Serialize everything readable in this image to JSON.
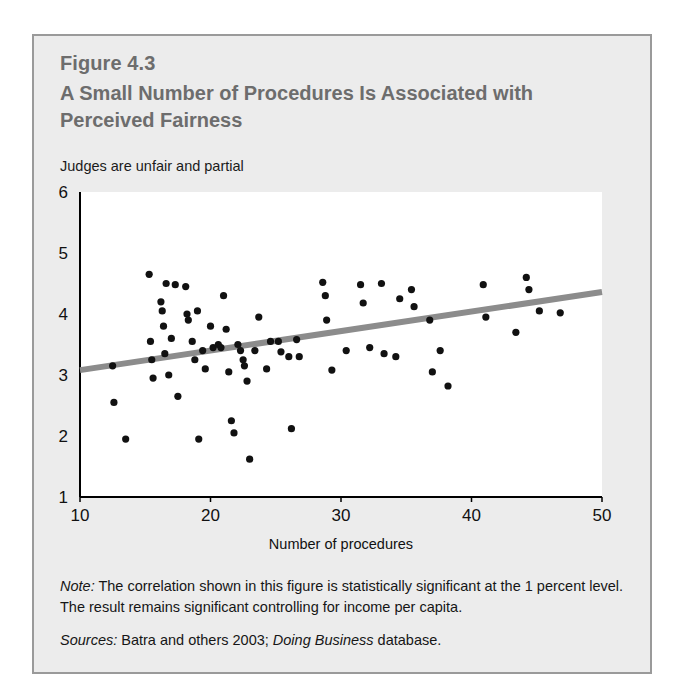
{
  "figure": {
    "number": "Figure 4.3",
    "title": "A Small Number of Procedures Is Associated with Perceived Fairness",
    "subtitle": "Judges are unfair and partial",
    "note_label": "Note:",
    "note_text": " The correlation shown in this figure is statistically significant at the 1 percent level. The result remains significant controlling for income per capita.",
    "sources_label": "Sources:",
    "sources_text_1": " Batra and others 2003; ",
    "sources_italic": "Doing Business",
    "sources_text_2": " database."
  },
  "colors": {
    "panel_background": "#ececec",
    "panel_border": "#9a9a9a",
    "title_text": "#6d6d6d",
    "body_text": "#161616",
    "plot_background": "#ffffff",
    "axis": "#000000",
    "point": "#111111",
    "trendline": "#8c8c8c"
  },
  "chart_data": {
    "type": "scatter",
    "title": "A Small Number of Procedures Is Associated with Perceived Fairness",
    "subtitle": "Judges are unfair and partial",
    "xlabel": "Number of procedures",
    "ylabel": "Judges are unfair and partial",
    "xlim": [
      10,
      50
    ],
    "ylim": [
      1,
      6
    ],
    "xticks": [
      10,
      20,
      30,
      40,
      50
    ],
    "yticks": [
      1,
      2,
      3,
      4,
      5,
      6
    ],
    "xtick_labels": [
      "10",
      "20",
      "30",
      "40",
      "50"
    ],
    "ytick_labels": [
      "1",
      "2",
      "3",
      "4",
      "5",
      "6"
    ],
    "grid": false,
    "legend": false,
    "points": [
      [
        12.5,
        3.15
      ],
      [
        12.6,
        2.55
      ],
      [
        13.5,
        1.95
      ],
      [
        15.3,
        4.65
      ],
      [
        15.4,
        3.55
      ],
      [
        15.5,
        3.25
      ],
      [
        15.6,
        2.95
      ],
      [
        16.2,
        4.2
      ],
      [
        16.3,
        4.05
      ],
      [
        16.4,
        3.8
      ],
      [
        16.5,
        3.35
      ],
      [
        16.6,
        4.5
      ],
      [
        16.8,
        3.0
      ],
      [
        17.0,
        3.6
      ],
      [
        17.3,
        4.48
      ],
      [
        17.5,
        2.65
      ],
      [
        18.1,
        4.45
      ],
      [
        18.2,
        4.0
      ],
      [
        18.3,
        3.9
      ],
      [
        18.6,
        3.55
      ],
      [
        18.8,
        3.25
      ],
      [
        19.0,
        4.05
      ],
      [
        19.1,
        1.95
      ],
      [
        19.4,
        3.4
      ],
      [
        19.6,
        3.1
      ],
      [
        20.0,
        3.8
      ],
      [
        20.2,
        3.45
      ],
      [
        20.6,
        3.5
      ],
      [
        20.8,
        3.45
      ],
      [
        21.0,
        4.3
      ],
      [
        21.2,
        3.75
      ],
      [
        21.4,
        3.05
      ],
      [
        21.6,
        2.25
      ],
      [
        21.8,
        2.05
      ],
      [
        22.1,
        3.5
      ],
      [
        22.3,
        3.4
      ],
      [
        22.5,
        3.25
      ],
      [
        22.6,
        3.15
      ],
      [
        22.8,
        2.9
      ],
      [
        23.0,
        1.62
      ],
      [
        23.4,
        3.4
      ],
      [
        23.7,
        3.95
      ],
      [
        24.3,
        3.1
      ],
      [
        24.6,
        3.55
      ],
      [
        25.2,
        3.55
      ],
      [
        25.4,
        3.38
      ],
      [
        26.0,
        3.3
      ],
      [
        26.2,
        2.12
      ],
      [
        26.6,
        3.58
      ],
      [
        26.8,
        3.3
      ],
      [
        28.6,
        4.52
      ],
      [
        28.8,
        4.3
      ],
      [
        28.9,
        3.9
      ],
      [
        29.3,
        3.08
      ],
      [
        30.4,
        3.4
      ],
      [
        31.5,
        4.48
      ],
      [
        31.7,
        4.18
      ],
      [
        32.2,
        3.45
      ],
      [
        33.1,
        4.5
      ],
      [
        33.3,
        3.35
      ],
      [
        34.2,
        3.3
      ],
      [
        34.5,
        4.25
      ],
      [
        35.4,
        4.4
      ],
      [
        35.6,
        4.12
      ],
      [
        36.8,
        3.9
      ],
      [
        37.0,
        3.05
      ],
      [
        37.6,
        3.4
      ],
      [
        38.2,
        2.82
      ],
      [
        40.9,
        4.48
      ],
      [
        41.1,
        3.95
      ],
      [
        43.4,
        3.7
      ],
      [
        44.2,
        4.6
      ],
      [
        44.4,
        4.4
      ],
      [
        45.2,
        4.05
      ],
      [
        46.8,
        4.02
      ]
    ],
    "trendline": {
      "x_start": 10,
      "y_start": 3.08,
      "x_end": 50,
      "y_end": 4.36
    }
  }
}
